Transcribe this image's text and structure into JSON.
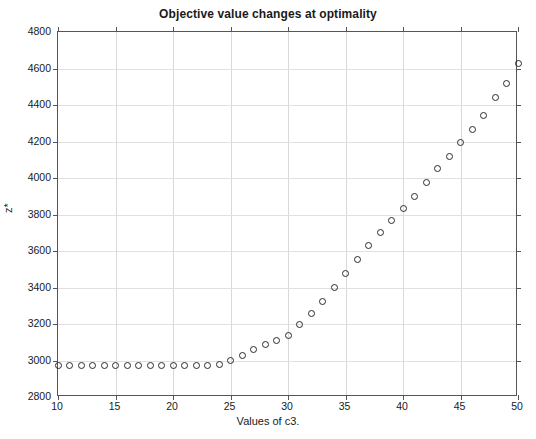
{
  "figure": {
    "background_color": "#ffffff",
    "axis_color": "#555555",
    "grid_color": "#d9d9d9",
    "marker_color": "#2b2b2b"
  },
  "chart_data": {
    "type": "scatter",
    "title": "Objective value changes at optimality",
    "xlabel": "Values of c3.",
    "ylabel": "z*",
    "xlim": [
      10,
      50
    ],
    "ylim": [
      2800,
      4800
    ],
    "xticks": [
      10,
      15,
      20,
      25,
      30,
      35,
      40,
      45,
      50
    ],
    "yticks": [
      2800,
      3000,
      3200,
      3400,
      3600,
      3800,
      4000,
      4200,
      4400,
      4600,
      4800
    ],
    "grid": true,
    "legend": null,
    "marker": "open-circle",
    "x": [
      10,
      11,
      12,
      13,
      14,
      15,
      16,
      17,
      18,
      19,
      20,
      21,
      22,
      23,
      24,
      25,
      26,
      27,
      28,
      29,
      30,
      31,
      32,
      33,
      34,
      35,
      36,
      37,
      38,
      39,
      40,
      41,
      42,
      43,
      44,
      45,
      46,
      47,
      48,
      49,
      50
    ],
    "values": [
      2975,
      2975,
      2975,
      2975,
      2975,
      2975,
      2975,
      2975,
      2975,
      2975,
      2975,
      2975,
      2975,
      2975,
      2980,
      3000,
      3030,
      3060,
      3085,
      3110,
      3135,
      3195,
      3260,
      3325,
      3400,
      3475,
      3555,
      3630,
      3700,
      3765,
      3835,
      3900,
      3975,
      4050,
      4120,
      4195,
      4265,
      4340,
      4440,
      4520,
      4630
    ]
  }
}
